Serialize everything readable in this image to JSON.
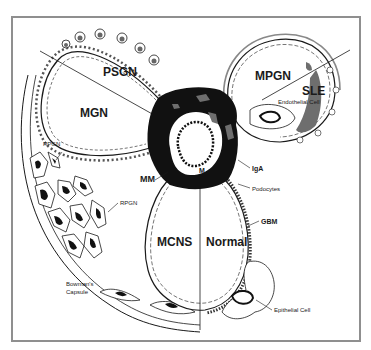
{
  "diagram": {
    "type": "glomerulus-schematic",
    "regions": [
      {
        "id": "psgn",
        "label": "PSGN"
      },
      {
        "id": "mgn",
        "label": "MGN"
      },
      {
        "id": "mpgn",
        "label": "MPGN"
      },
      {
        "id": "sle",
        "label": "SLE"
      },
      {
        "id": "mcns",
        "label": "MCNS"
      },
      {
        "id": "normal",
        "label": "Normal"
      }
    ],
    "annotations": {
      "endothelial_cell": "Endothelial Cell",
      "iga": "IgA",
      "m": "M",
      "mm": "MM",
      "rpgn_top": "RPGN",
      "rpgn_mid": "RPGN",
      "podocytes": "Podocytes",
      "gbm": "GBM",
      "bowmans_line1": "Bowman's",
      "bowmans_line2": "Capsule",
      "epithelial_cell": "Epithelial Cell"
    },
    "colors": {
      "frame": "#8f8f8f",
      "mesangium": "#111111",
      "deposit": "#6e6e6e",
      "line": "#1a1a1a",
      "background": "#ffffff"
    }
  }
}
